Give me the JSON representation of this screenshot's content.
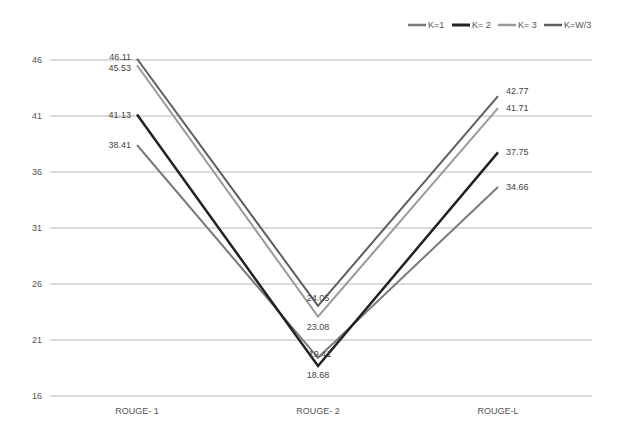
{
  "chart_data": {
    "type": "line",
    "title": "",
    "xlabel": "",
    "ylabel": "",
    "categories": [
      "ROUGE- 1",
      "ROUGE- 2",
      "ROUGE-L"
    ],
    "yticks": [
      16,
      21,
      26,
      31,
      36,
      41,
      46
    ],
    "ylim": [
      16,
      46
    ],
    "grid": true,
    "legend_position": "top-right",
    "series": [
      {
        "name": "K=1",
        "values": [
          38.41,
          19.41,
          34.66
        ],
        "color": "#7a7a7a",
        "width": 2
      },
      {
        "name": "K= 2",
        "values": [
          41.13,
          18.68,
          37.75
        ],
        "color": "#222222",
        "width": 2.5
      },
      {
        "name": "K= 3",
        "values": [
          45.53,
          23.08,
          41.71
        ],
        "color": "#9a9a9a",
        "width": 2
      },
      {
        "name": "K=W/3",
        "values": [
          46.11,
          24.05,
          42.77
        ],
        "color": "#5e5e5e",
        "width": 2
      }
    ]
  }
}
